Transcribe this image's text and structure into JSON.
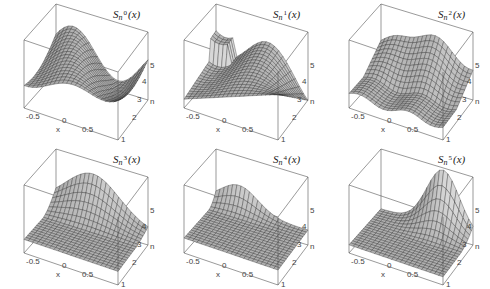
{
  "figure": {
    "layout": {
      "rows": 2,
      "cols": 3
    },
    "colors": {
      "surface_light": "#b8b8b8",
      "surface_dark": "#3a3a3a",
      "mesh": "#2a2a2a",
      "box": "#555555",
      "background": "#ffffff"
    }
  },
  "chart_data": [
    {
      "type": "surface3d",
      "title": "S_n^0(x)",
      "title_parts": {
        "base": "S",
        "sub": "n",
        "sup": "0",
        "arg": "(x)"
      },
      "xlabel": "x",
      "ylabel": "n",
      "zlabel": "",
      "x_ticks": [
        "-0.5",
        "0",
        "0.5",
        "1"
      ],
      "n_ticks": [
        "1",
        "2",
        "3",
        "4",
        "5"
      ],
      "x_range": [
        -1,
        1
      ],
      "n_range": [
        1,
        5
      ],
      "description": "Wavy surface, high ridges on far side, rising at right edge"
    },
    {
      "type": "surface3d",
      "title": "S_n^1(x)",
      "title_parts": {
        "base": "S",
        "sub": "n",
        "sup": "1",
        "arg": "(x)"
      },
      "xlabel": "x",
      "ylabel": "n",
      "zlabel": "",
      "x_ticks": [
        "-0.5",
        "0",
        "0.5",
        "1"
      ],
      "n_ticks": [
        "1",
        "2",
        "3",
        "4",
        "5"
      ],
      "x_range": [
        -1,
        1
      ],
      "n_range": [
        1,
        5
      ],
      "description": "Twisted saddle-like surface with dark underside at left"
    },
    {
      "type": "surface3d",
      "title": "S_n^2(x)",
      "title_parts": {
        "base": "S",
        "sub": "n",
        "sup": "2",
        "arg": "(x)"
      },
      "xlabel": "x",
      "ylabel": "n",
      "zlabel": "",
      "x_ticks": [
        "-0.5",
        "0",
        "0.5",
        "1"
      ],
      "n_ticks": [
        "1",
        "2",
        "3",
        "4",
        "5"
      ],
      "x_range": [
        -1,
        1
      ],
      "n_range": [
        1,
        5
      ],
      "description": "Flat for low n, ridge rising at back for high n"
    },
    {
      "type": "surface3d",
      "title": "S_n^3(x)",
      "title_parts": {
        "base": "S",
        "sub": "n",
        "sup": "3",
        "arg": "(x)"
      },
      "xlabel": "x",
      "ylabel": "n",
      "zlabel": "",
      "x_ticks": [
        "-0.5",
        "0",
        "0.5",
        "1"
      ],
      "n_ticks": [
        "1",
        "2",
        "3",
        "4",
        "5"
      ],
      "x_range": [
        -1,
        1
      ],
      "n_range": [
        1,
        5
      ],
      "description": "Mostly flat plane with peak at back near n=5"
    },
    {
      "type": "surface3d",
      "title": "S_n^4(x)",
      "title_parts": {
        "base": "S",
        "sub": "n",
        "sup": "4",
        "arg": "(x)"
      },
      "xlabel": "x",
      "ylabel": "n",
      "zlabel": "",
      "x_ticks": [
        "-0.5",
        "0",
        "0.5",
        "1"
      ],
      "n_ticks": [
        "1",
        "2",
        "3",
        "4",
        "5"
      ],
      "x_range": [
        -1,
        1
      ],
      "n_range": [
        1,
        5
      ],
      "description": "Flat plane with small bump at back corner n=5"
    },
    {
      "type": "surface3d",
      "title": "S_n^5(x)",
      "title_parts": {
        "base": "S",
        "sub": "n",
        "sup": "5",
        "arg": "(x)"
      },
      "xlabel": "x",
      "ylabel": "n",
      "zlabel": "",
      "x_ticks": [
        "-0.5",
        "0",
        "0.5",
        "1"
      ],
      "n_ticks": [
        "1",
        "2",
        "3",
        "4",
        "5"
      ],
      "x_range": [
        -1,
        1
      ],
      "n_range": [
        1,
        5
      ],
      "description": "Zero plane with single bell-shaped peak at n=5, x≈0.5"
    }
  ]
}
